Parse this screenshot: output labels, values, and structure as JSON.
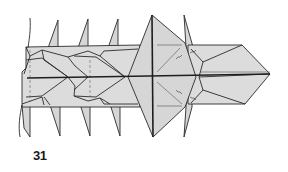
{
  "figure": {
    "type": "origami folding diagram",
    "step_number": "31",
    "colors": {
      "paper_fill": "#d6d6d6",
      "line": "#2a2a2a",
      "background": "#ffffff"
    }
  }
}
